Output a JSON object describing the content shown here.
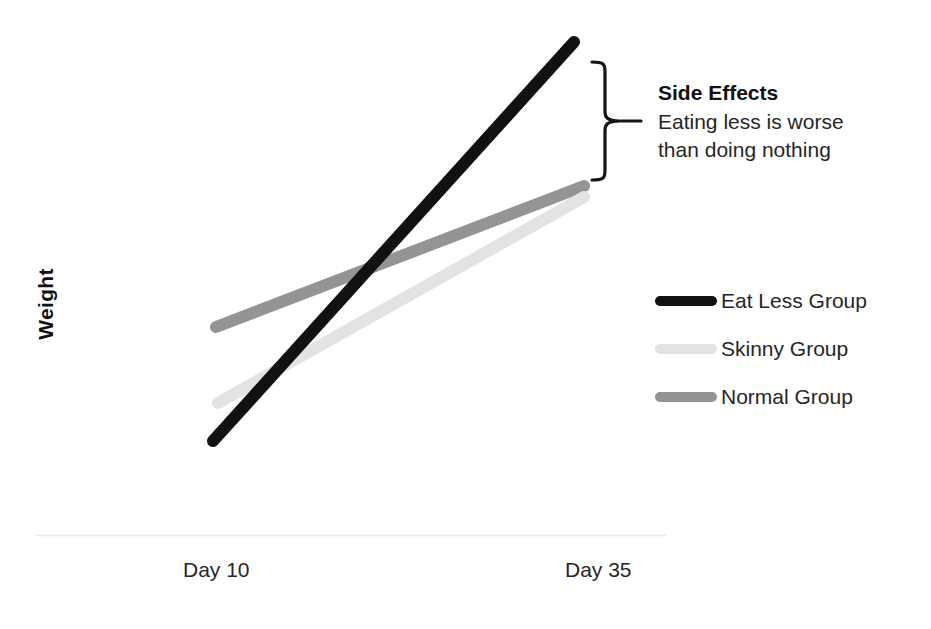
{
  "chart_data": {
    "type": "line",
    "title": "",
    "xlabel": "",
    "ylabel": "Weight",
    "x": [
      "Day 10",
      "Day 35"
    ],
    "categories": [
      "Day 10",
      "Day 35"
    ],
    "grid": false,
    "legend_position": "right",
    "xlim": [
      0,
      1
    ],
    "ylim": [
      0,
      1
    ],
    "series": [
      {
        "name": "Eat Less Group",
        "color": "#111111",
        "values": [
          0.18,
          0.92
        ],
        "points": [
          [
            213,
            441
          ],
          [
            574,
            42
          ]
        ]
      },
      {
        "name": "Skinny Group",
        "color": "#e3e3e3",
        "values": [
          0.26,
          0.66
        ],
        "points": [
          [
            218,
            403
          ],
          [
            584,
            197
          ]
        ]
      },
      {
        "name": "Normal Group",
        "color": "#949494",
        "values": [
          0.4,
          0.68
        ],
        "points": [
          [
            216,
            327
          ],
          [
            584,
            186
          ]
        ]
      }
    ],
    "annotations": [
      {
        "type": "brace",
        "title": "Side Effects",
        "lines": [
          "Eating less is worse",
          "than doing nothing"
        ],
        "spans_series": [
          "Eat Less Group",
          "Normal Group"
        ]
      }
    ],
    "axis_line_color": "#e8e8e8"
  },
  "axes": {
    "y_title": "Weight",
    "x_ticks": [
      "Day 10",
      "Day 35"
    ]
  },
  "annotation": {
    "title": "Side Effects",
    "line1": "Eating less is worse",
    "line2": "than doing nothing"
  },
  "legend": {
    "items": [
      {
        "label": "Eat Less Group",
        "color": "#111111"
      },
      {
        "label": "Skinny Group",
        "color": "#e3e3e3"
      },
      {
        "label": "Normal Group",
        "color": "#949494"
      }
    ]
  }
}
